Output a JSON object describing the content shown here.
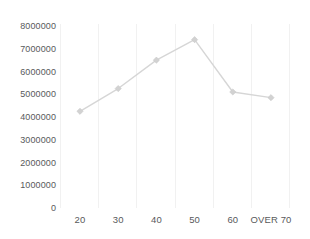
{
  "chart_data": {
    "type": "line",
    "title": "",
    "subtitle": "",
    "xlabel": "",
    "ylabel": "",
    "categories": [
      "20",
      "30",
      "40",
      "50",
      "60",
      "OVER 70"
    ],
    "values": [
      4250000,
      5250000,
      6500000,
      7400000,
      5100000,
      4850000
    ],
    "series": [
      {
        "name": "",
        "values": [
          4250000,
          5250000,
          6500000,
          7400000,
          5100000,
          4850000
        ]
      }
    ],
    "ylim": [
      0,
      8000000
    ],
    "ytick_values": [
      0,
      1000000,
      2000000,
      3000000,
      4000000,
      5000000,
      6000000,
      7000000,
      8000000
    ],
    "ytick_labels": [
      "0",
      "1000000",
      "2000000",
      "3000000",
      "4000000",
      "5000000",
      "6000000",
      "7000000",
      "8000000"
    ],
    "xtick_labels": [
      "20",
      "30",
      "40",
      "50",
      "60",
      "OVER 70"
    ],
    "grid": {
      "vertical": true,
      "horizontal": false,
      "color": "#f1f1f1"
    },
    "legend": {
      "visible": false,
      "position": "none",
      "entries": []
    },
    "annotations": [],
    "marker": "diamond",
    "colors": {
      "line": "#d6d6d6",
      "marker": "#d2d2d2",
      "tick_label": "#58595b",
      "background": "#ffffff"
    }
  },
  "axes": {
    "y_ticks": [
      {
        "label": "8000000",
        "value": 8000000
      },
      {
        "label": "7000000",
        "value": 7000000
      },
      {
        "label": "6000000",
        "value": 6000000
      },
      {
        "label": "5000000",
        "value": 5000000
      },
      {
        "label": "4000000",
        "value": 4000000
      },
      {
        "label": "3000000",
        "value": 3000000
      },
      {
        "label": "2000000",
        "value": 2000000
      },
      {
        "label": "1000000",
        "value": 1000000
      },
      {
        "label": "0",
        "value": 0
      }
    ],
    "x_ticks": [
      {
        "label": "20"
      },
      {
        "label": "30"
      },
      {
        "label": "40"
      },
      {
        "label": "50"
      },
      {
        "label": "60"
      },
      {
        "label": "OVER 70"
      }
    ]
  }
}
